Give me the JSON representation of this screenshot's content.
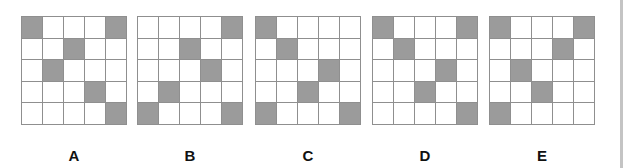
{
  "options": [
    {
      "label": "A",
      "filled": [
        [
          0,
          0
        ],
        [
          0,
          4
        ],
        [
          1,
          2
        ],
        [
          2,
          1
        ],
        [
          3,
          3
        ],
        [
          4,
          4
        ]
      ]
    },
    {
      "label": "B",
      "filled": [
        [
          0,
          4
        ],
        [
          1,
          2
        ],
        [
          2,
          3
        ],
        [
          3,
          1
        ],
        [
          4,
          0
        ],
        [
          4,
          4
        ]
      ]
    },
    {
      "label": "C",
      "filled": [
        [
          0,
          0
        ],
        [
          1,
          1
        ],
        [
          2,
          3
        ],
        [
          3,
          2
        ],
        [
          4,
          0
        ],
        [
          4,
          4
        ]
      ]
    },
    {
      "label": "D",
      "filled": [
        [
          0,
          0
        ],
        [
          0,
          4
        ],
        [
          1,
          1
        ],
        [
          2,
          3
        ],
        [
          3,
          2
        ],
        [
          4,
          4
        ]
      ]
    },
    {
      "label": "E",
      "filled": [
        [
          0,
          0
        ],
        [
          0,
          4
        ],
        [
          1,
          3
        ],
        [
          2,
          1
        ],
        [
          3,
          2
        ],
        [
          4,
          0
        ]
      ]
    }
  ],
  "grid": {
    "rows": 5,
    "cols": 5
  },
  "colors": {
    "filled": "#9b9b9b",
    "empty": "#ffffff",
    "line": "#8f8f8f"
  }
}
